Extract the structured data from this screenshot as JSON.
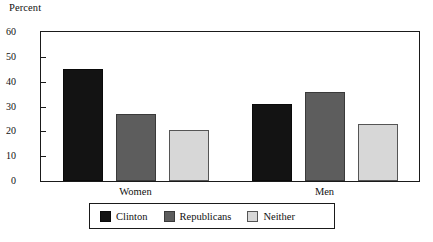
{
  "chart_data": {
    "type": "bar",
    "title": "",
    "subtitle": "",
    "xlabel": "",
    "ylabel": "Percent",
    "ylim": [
      0,
      60
    ],
    "ytick_values": [
      0,
      10,
      20,
      30,
      40,
      50,
      60
    ],
    "ytick_labels": [
      "0",
      "10",
      "20",
      "30",
      "40",
      "50",
      "60"
    ],
    "grid": false,
    "legend_position": "bottom",
    "categories": [
      "Women",
      "Men"
    ],
    "series": [
      {
        "name": "Clinton",
        "color": "#131313",
        "values": [
          45,
          31
        ]
      },
      {
        "name": "Republicans",
        "color": "#5d5d5d",
        "values": [
          27,
          36
        ]
      },
      {
        "name": "Neither",
        "color": "#d7d7d7",
        "values": [
          20.5,
          23
        ]
      }
    ]
  },
  "legend": {
    "items": [
      {
        "label": "Clinton"
      },
      {
        "label": "Republicans"
      },
      {
        "label": "Neither"
      }
    ]
  },
  "colors": {
    "axis": "#1a1a1a",
    "background": "#ffffff",
    "clinton": "#131313",
    "republicans": "#5d5d5d",
    "neither": "#d7d7d7"
  }
}
